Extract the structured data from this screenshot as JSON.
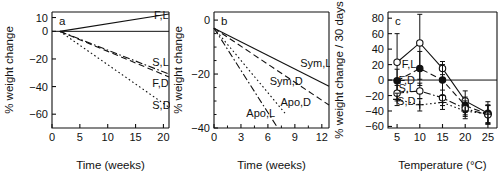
{
  "figure": {
    "background": "#ffffff",
    "foreground": "#111111",
    "width": 498,
    "height": 173
  },
  "chart_data": [
    {
      "type": "line",
      "panel": "a",
      "title": "",
      "xlabel": "Time (weeks)",
      "ylabel": "% weight change",
      "xlim": [
        0,
        21
      ],
      "ylim": [
        -70,
        14
      ],
      "xticks": [
        0,
        5,
        10,
        15,
        20
      ],
      "yticks": [
        10,
        0,
        -20,
        -40,
        -60
      ],
      "ytick_labels": [
        "10",
        "0",
        "−20",
        "−40",
        "−60"
      ],
      "xtick_labels": [
        "0",
        "5",
        "10",
        "15",
        "20"
      ],
      "grid": false,
      "zero_line": true,
      "legend": "inline-labels",
      "series": [
        {
          "name": "F,L",
          "style": "solid",
          "label_x": 18.3,
          "label_y": 9.0,
          "x": [
            1.4,
            21.0
          ],
          "values": [
            0,
            12.5
          ]
        },
        {
          "name": "S,L",
          "style": "dashdot",
          "label_x": 18.0,
          "label_y": -25.0,
          "x": [
            1.4,
            21.0
          ],
          "values": [
            0,
            -31.0
          ]
        },
        {
          "name": "F,D",
          "style": "dashed",
          "label_x": 18.0,
          "label_y": -40.5,
          "x": [
            1.4,
            21.0
          ],
          "values": [
            0,
            -33.0
          ]
        },
        {
          "name": "S,D",
          "style": "dotted",
          "label_x": 18.0,
          "label_y": -56.0,
          "x": [
            1.4,
            21.0
          ],
          "values": [
            0,
            -55.0
          ]
        }
      ]
    },
    {
      "type": "line",
      "panel": "b",
      "title": "",
      "xlabel": "Time (weeks)",
      "ylabel": "% weight change",
      "xlim": [
        0,
        12.8
      ],
      "ylim": [
        -40,
        3
      ],
      "xticks": [
        0,
        3,
        6,
        9,
        12
      ],
      "yticks": [
        0,
        -20,
        -40
      ],
      "ytick_labels": [
        "0",
        "−20",
        "−40"
      ],
      "xtick_labels": [
        "0",
        "3",
        "6",
        "9",
        "12"
      ],
      "yticks_minor": [
        -5,
        -10,
        -15,
        -25,
        -30,
        -35
      ],
      "xticks_minor": [
        1.5,
        4.5,
        7.5,
        10.5
      ],
      "grid": false,
      "legend": "inline-labels",
      "series": [
        {
          "name": "Sym,L",
          "style": "solid",
          "label_x": 9.6,
          "label_y": -17.5,
          "x": [
            0.0,
            12.8
          ],
          "values": [
            -3.0,
            -24.5
          ]
        },
        {
          "name": "Sym,D",
          "style": "dashed",
          "label_x": 6.2,
          "label_y": -24.0,
          "x": [
            0.0,
            12.8
          ],
          "values": [
            -3.0,
            -31.5
          ]
        },
        {
          "name": "Apo,D",
          "style": "dotted",
          "label_x": 7.4,
          "label_y": -32.0,
          "x": [
            0.0,
            7.9
          ],
          "values": [
            -3.0,
            -34.5
          ]
        },
        {
          "name": "Apo,L",
          "style": "dashdot",
          "label_x": 3.6,
          "label_y": -36.0,
          "x": [
            0.0,
            7.0
          ],
          "values": [
            -3.0,
            -39.5
          ]
        }
      ]
    },
    {
      "type": "line",
      "panel": "c",
      "title": "",
      "xlabel": "Temperature (°C)",
      "ylabel": "% weight change / 30 days",
      "xlim": [
        3,
        27
      ],
      "ylim": [
        -62,
        88
      ],
      "xticks": [
        5,
        10,
        15,
        20,
        25
      ],
      "yticks": [
        80,
        60,
        40,
        20,
        0,
        -20,
        -40,
        -60
      ],
      "ytick_labels": [
        "80",
        "60",
        "40",
        "20",
        "0",
        "−20",
        "−40",
        "−60"
      ],
      "xtick_labels": [
        "5",
        "10",
        "15",
        "20",
        "25"
      ],
      "grid": false,
      "zero_line": true,
      "legend": "inline-labels",
      "x": [
        5,
        10,
        15,
        20,
        25
      ],
      "series": [
        {
          "name": "F,L",
          "style": "solid",
          "marker": "open-circle",
          "label_x": 6.0,
          "label_y": 15.0,
          "values": [
            23,
            48,
            15,
            -27,
            -43
          ],
          "err_low": [
            -14,
            1,
            7,
            -42,
            -57
          ],
          "err_high": [
            60,
            85,
            24,
            -14,
            -28
          ]
        },
        {
          "name": "F,D",
          "style": "dashed",
          "marker": "filled-circle",
          "label_x": 5.3,
          "label_y": -5.0,
          "values": [
            -1,
            15,
            0,
            -33,
            -44
          ],
          "err_low": [
            -16,
            -7,
            -20,
            -45,
            -56
          ],
          "err_high": [
            14,
            37,
            20,
            -22,
            -32
          ]
        },
        {
          "name": "S,L",
          "style": "dashdot",
          "marker": "open-circle",
          "label_x": 5.3,
          "label_y": -16.0,
          "values": [
            -17,
            -14,
            -23,
            -37,
            -45
          ],
          "err_low": [
            -27,
            -24,
            -33,
            -47,
            -57
          ],
          "err_high": [
            -7,
            -4,
            -13,
            -27,
            -33
          ]
        },
        {
          "name": "S,D",
          "style": "dotted",
          "marker": "filled-plus",
          "label_x": 5.0,
          "label_y": -32.0,
          "values": [
            -25,
            -32,
            -29,
            -40,
            -44
          ],
          "err_low": [
            -33,
            -40,
            -38,
            -50,
            -55
          ],
          "err_high": [
            -17,
            -24,
            -20,
            -30,
            -33
          ]
        }
      ]
    }
  ],
  "panels": {
    "a": {
      "letter": "a",
      "xlabel": "Time (weeks)",
      "ylabel": "% weight change"
    },
    "b": {
      "letter": "b",
      "xlabel": "Time (weeks)",
      "ylabel": "% weight change"
    },
    "c": {
      "letter": "c",
      "xlabel": "Temperature (°C)",
      "ylabel": "% weight change / 30 days"
    }
  }
}
